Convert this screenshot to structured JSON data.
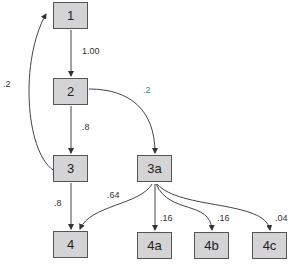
{
  "nodes": [
    {
      "id": "1",
      "label": "1"
    },
    {
      "id": "2",
      "label": "2"
    },
    {
      "id": "3",
      "label": "3"
    },
    {
      "id": "3a",
      "label": "3a"
    },
    {
      "id": "4",
      "label": "4"
    },
    {
      "id": "4a",
      "label": "4a"
    },
    {
      "id": "4b",
      "label": "4b"
    },
    {
      "id": "4c",
      "label": "4c"
    }
  ],
  "edges": [
    {
      "from": "1",
      "to": "2",
      "label": "1.00"
    },
    {
      "from": "2",
      "to": "3",
      "label": ".8"
    },
    {
      "from": "2",
      "to": "3a",
      "label": ".2"
    },
    {
      "from": "3",
      "to": "1",
      "label": ".2"
    },
    {
      "from": "3",
      "to": "4",
      "label": ".8"
    },
    {
      "from": "3a",
      "to": "4",
      "label": ".64"
    },
    {
      "from": "3a",
      "to": "4a",
      "label": ".16"
    },
    {
      "from": "3a",
      "to": "4b",
      "label": ".16"
    },
    {
      "from": "3a",
      "to": "4c",
      "label": ".04"
    }
  ]
}
